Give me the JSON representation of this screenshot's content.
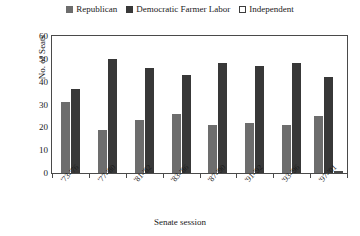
{
  "chart_data": {
    "type": "bar",
    "title": "",
    "xlabel": "Senate session",
    "ylabel": "No. of Seats",
    "ylim": [
      0,
      60
    ],
    "yticks": [
      0,
      10,
      20,
      30,
      40,
      50,
      60
    ],
    "grid": false,
    "legend_position": "top-center",
    "categories": [
      "'73-'76",
      "'77-'80",
      "'81-'82",
      "'83-'86",
      "'87-'90",
      "'91-'92",
      "'93-'96",
      "'97-'01"
    ],
    "series": [
      {
        "name": "Republican",
        "color": "#6d6d6d",
        "values": [
          31,
          19,
          23,
          26,
          21,
          22,
          21,
          25
        ]
      },
      {
        "name": "Democratic Farmer Labor",
        "color": "#383838",
        "values": [
          37,
          50,
          46,
          43,
          48,
          47,
          48,
          42
        ]
      },
      {
        "name": "Independent",
        "color": "#ffffff",
        "values": [
          0,
          0,
          0,
          0,
          0,
          0,
          0,
          1
        ]
      }
    ]
  }
}
